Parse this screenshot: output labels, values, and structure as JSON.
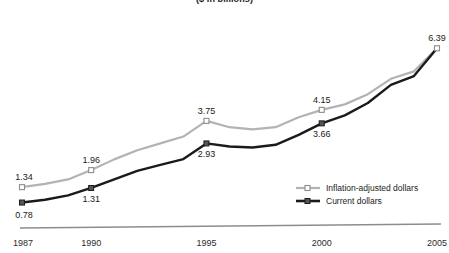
{
  "chart_data": {
    "type": "line",
    "title": "($ in billions)",
    "xlabel": "",
    "ylabel": "",
    "x": [
      1987,
      1988,
      1989,
      1990,
      1991,
      1992,
      1993,
      1994,
      1995,
      1996,
      1997,
      1998,
      1999,
      2000,
      2001,
      2002,
      2003,
      2004,
      2005
    ],
    "xticks": [
      "1987",
      "1990",
      "1995",
      "2000",
      "2005"
    ],
    "xtick_values": [
      1987,
      1990,
      1995,
      2000,
      2005
    ],
    "xlim": [
      1987,
      2005
    ],
    "ylim": [
      0,
      7.2
    ],
    "grid": false,
    "legend_position": "bottom-right",
    "series": [
      {
        "name": "Inflation-adjusted dollars",
        "color": "#b3b3b3",
        "marker": "square-open",
        "values": [
          1.34,
          1.46,
          1.62,
          1.96,
          2.35,
          2.68,
          2.93,
          3.18,
          3.75,
          3.52,
          3.44,
          3.52,
          3.88,
          4.15,
          4.35,
          4.72,
          5.28,
          5.55,
          6.39
        ],
        "labeled_points": [
          {
            "x": 1987,
            "value": 1.34,
            "label": "1.34",
            "position": "above-left"
          },
          {
            "x": 1990,
            "value": 1.96,
            "label": "1.96",
            "position": "above"
          },
          {
            "x": 1995,
            "value": 3.75,
            "label": "3.75",
            "position": "above"
          },
          {
            "x": 2000,
            "value": 4.15,
            "label": "4.15",
            "position": "above"
          },
          {
            "x": 2005,
            "value": 6.39,
            "label": "6.39",
            "position": "above"
          }
        ]
      },
      {
        "name": "Current dollars",
        "color": "#1a1a1a",
        "marker": "square-solid",
        "values": [
          0.78,
          0.88,
          1.04,
          1.31,
          1.62,
          1.93,
          2.15,
          2.36,
          2.93,
          2.82,
          2.78,
          2.88,
          3.24,
          3.66,
          3.95,
          4.4,
          5.06,
          5.38,
          6.39
        ],
        "labeled_points": [
          {
            "x": 1987,
            "value": 0.78,
            "label": "0.78",
            "position": "below-left"
          },
          {
            "x": 1990,
            "value": 1.31,
            "label": "1.31",
            "position": "below"
          },
          {
            "x": 1995,
            "value": 2.93,
            "label": "2.93",
            "position": "below"
          },
          {
            "x": 2000,
            "value": 3.66,
            "label": "3.66",
            "position": "below"
          }
        ]
      }
    ],
    "legend": [
      {
        "label": "Inflation-adjusted dollars",
        "color": "#b3b3b3",
        "marker": "square-open"
      },
      {
        "label": "Current dollars",
        "color": "#1a1a1a",
        "marker": "square-solid"
      }
    ],
    "axis_color": "#808080"
  }
}
